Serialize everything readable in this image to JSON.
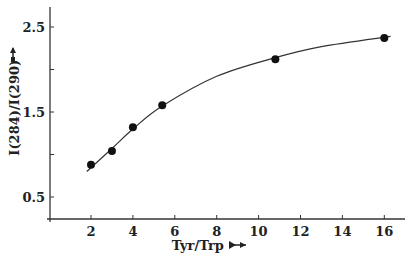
{
  "chart_data": {
    "type": "scatter",
    "title": "",
    "xlabel": "Tyr/Trp",
    "ylabel": "I(284)/I(290)",
    "x_ticks": [
      "2",
      "4",
      "6",
      "8",
      "10",
      "12",
      "14",
      "16"
    ],
    "y_ticks": [
      "0.5",
      "1.5",
      "2.5"
    ],
    "xlim": [
      0,
      17
    ],
    "ylim": [
      0.3,
      2.7
    ],
    "grid": false,
    "legend": null,
    "series": [
      {
        "name": "measured",
        "style": "filled-circle",
        "x": [
          2,
          3,
          4,
          5.4,
          10.8,
          16
        ],
        "y": [
          0.88,
          1.04,
          1.32,
          1.58,
          2.12,
          2.37
        ]
      },
      {
        "name": "fit-curve",
        "style": "smooth-line",
        "x": [
          1.8,
          3,
          4,
          5.4,
          8,
          10.8,
          13,
          16.3
        ],
        "y": [
          0.8,
          1.07,
          1.3,
          1.57,
          1.92,
          2.14,
          2.27,
          2.39
        ]
      }
    ]
  },
  "labels": {
    "xlabel": "Tyr/Trp",
    "ylabel": "I(284)/I(290)",
    "x_arrow": "→",
    "y_arrow": "↑"
  }
}
